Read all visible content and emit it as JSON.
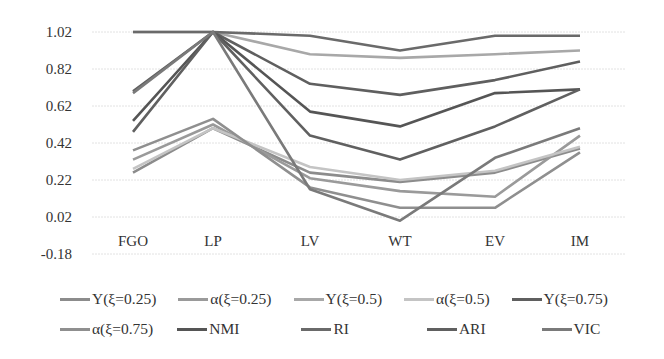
{
  "chart_data": {
    "type": "line",
    "title": "",
    "xlabel": "",
    "ylabel": "",
    "categories": [
      "FGO",
      "LP",
      "LV",
      "WT",
      "EV",
      "IM"
    ],
    "yticks": [
      "1.02",
      "0.82",
      "0.62",
      "0.42",
      "0.22",
      "0.02",
      "-0.18"
    ],
    "ylim": [
      -0.18,
      1.02
    ],
    "grid": true,
    "legend_position": "bottom",
    "series": [
      {
        "name": "Υ(ξ=0.25)",
        "color": "#8c8c8c",
        "values": [
          0.26,
          0.5,
          0.26,
          0.21,
          0.26,
          0.39
        ]
      },
      {
        "name": "α(ξ=0.25)",
        "color": "#9a9a9a",
        "values": [
          0.33,
          0.52,
          0.23,
          0.16,
          0.13,
          0.46
        ]
      },
      {
        "name": "Υ(ξ=0.5)",
        "color": "#a8a8a8",
        "values": [
          1.02,
          1.02,
          0.9,
          0.88,
          0.9,
          0.92
        ]
      },
      {
        "name": "α(ξ=0.5)",
        "color": "#c4c4c4",
        "values": [
          0.28,
          0.5,
          0.29,
          0.22,
          0.27,
          0.4
        ]
      },
      {
        "name": "Υ(ξ=0.75)",
        "color": "#5f5f5f",
        "values": [
          0.7,
          1.02,
          0.74,
          0.68,
          0.76,
          0.86
        ]
      },
      {
        "name": "α(ξ=0.75)",
        "color": "#8f8f8f",
        "values": [
          0.38,
          0.55,
          0.18,
          0.07,
          0.07,
          0.37
        ]
      },
      {
        "name": "NMI",
        "color": "#555555",
        "values": [
          0.54,
          1.02,
          0.59,
          0.51,
          0.69,
          0.71
        ]
      },
      {
        "name": "RI",
        "color": "#6a6a6a",
        "values": [
          1.02,
          1.02,
          1.0,
          0.92,
          1.0,
          1.0
        ]
      },
      {
        "name": "ARI",
        "color": "#606060",
        "values": [
          0.48,
          1.02,
          0.46,
          0.33,
          0.51,
          0.71
        ]
      },
      {
        "name": "VIC",
        "color": "#7a7a7a",
        "values": [
          0.69,
          1.02,
          0.17,
          0.0,
          0.34,
          0.5
        ]
      }
    ]
  },
  "legend": {
    "row1": [
      "Υ(ξ=0.25)",
      "α(ξ=0.25)",
      "Υ(ξ=0.5)",
      "α(ξ=0.5)",
      "Υ(ξ=0.75)"
    ],
    "row2": [
      "α(ξ=0.75)",
      "NMI",
      "RI",
      "ARI",
      "VIC"
    ]
  }
}
